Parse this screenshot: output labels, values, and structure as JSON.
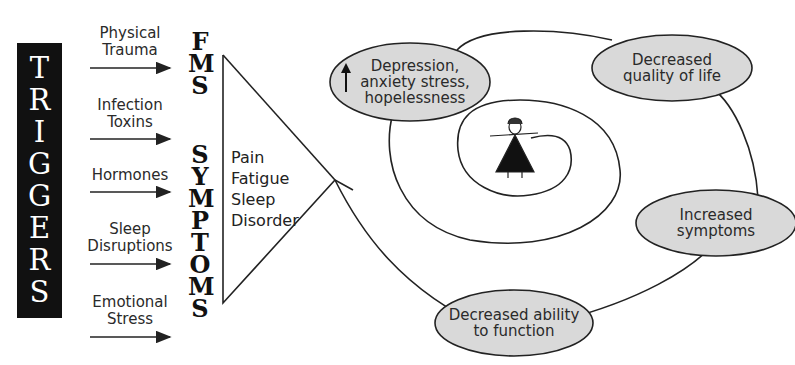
{
  "triggers": {
    "title_letters": [
      "T",
      "R",
      "I",
      "G",
      "G",
      "E",
      "R",
      "S"
    ],
    "items": [
      {
        "lines": [
          "Physical",
          "Trauma"
        ]
      },
      {
        "lines": [
          "Infection",
          "Toxins"
        ]
      },
      {
        "lines": [
          "Hormones"
        ]
      },
      {
        "lines": [
          "Sleep",
          "Disruptions"
        ]
      },
      {
        "lines": [
          "Emotional",
          "Stress"
        ]
      }
    ]
  },
  "fms_symptoms": {
    "fms_letters": [
      "F",
      "M",
      "S"
    ],
    "symptoms_letters": [
      "S",
      "Y",
      "M",
      "P",
      "T",
      "O",
      "M",
      "S"
    ]
  },
  "core_symptoms": [
    "Pain",
    "Fatigue",
    "Sleep",
    "Disorder"
  ],
  "cycle": {
    "nodes": [
      {
        "id": "depression",
        "prefix_icon": "up-arrow-icon",
        "lines": [
          "Depression,",
          "anxiety stress,",
          "hopelessness"
        ]
      },
      {
        "id": "quality",
        "lines": [
          "Decreased",
          "quality of life"
        ]
      },
      {
        "id": "symptoms",
        "lines": [
          "Increased",
          "symptoms"
        ]
      },
      {
        "id": "function",
        "lines": [
          "Decreased ability",
          "to function"
        ]
      }
    ],
    "center_figure": "person-figure"
  },
  "colors": {
    "bar": "#111111",
    "ellipse_fill": "#d9d9d9",
    "stroke": "#222222"
  }
}
